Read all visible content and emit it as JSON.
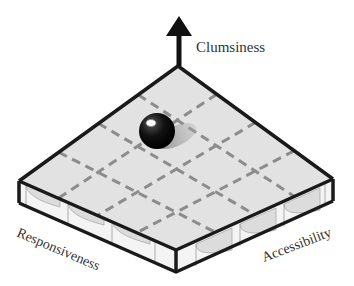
{
  "diagram": {
    "type": "isometric-grid-platform",
    "axes": {
      "vertical": "Clumsiness",
      "left": "Responsiveness",
      "right": "Accessibility"
    },
    "grid": {
      "rows": 4,
      "cols": 4,
      "line_style": "dashed"
    },
    "ball": {
      "description": "black sphere resting on platform",
      "color": "#111111"
    },
    "colors": {
      "surface": "#e2e2e2",
      "side": "#ececec",
      "edge": "#1a1a1a",
      "grid_line": "#8c8c8c",
      "arrow": "#111111"
    }
  }
}
